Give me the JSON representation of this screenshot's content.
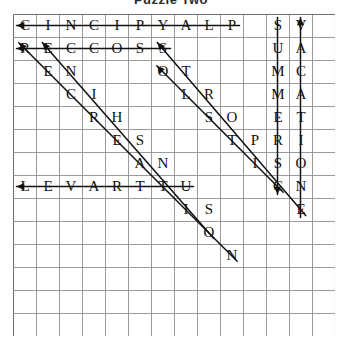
{
  "title": "Puzzle Two",
  "grid": {
    "columns": 13,
    "rows": 14,
    "cell_size": 23,
    "line_color": "#8e8e96",
    "border_color": "#6f6f78",
    "letter_color": "#101010",
    "mark_color": "#111111",
    "rows_letters": [
      [
        "C",
        "I",
        "N",
        "C",
        "I",
        "P",
        "Y",
        "A",
        "L",
        "P",
        "",
        "S",
        "V",
        ""
      ],
      [
        "R",
        "E",
        "C",
        "C",
        "O",
        "S",
        "S",
        "",
        "",
        "",
        "U",
        "A",
        ""
      ],
      [
        "",
        "E",
        "N",
        "",
        "",
        "O",
        "T",
        "",
        "",
        "",
        "M",
        "C",
        ""
      ],
      [
        "",
        "",
        "C",
        "I",
        "",
        "L",
        "R",
        "",
        "",
        "",
        "M",
        "A",
        ""
      ],
      [
        "",
        "",
        "",
        "R",
        "H",
        "",
        "S",
        "O",
        "",
        "",
        "E",
        "T",
        ""
      ],
      [
        "",
        "",
        "",
        "",
        "E",
        "S",
        "",
        "T",
        "P",
        "",
        "R",
        "I",
        ""
      ],
      [
        "",
        "",
        "",
        "",
        "",
        "A",
        "N",
        "",
        "I",
        "S",
        "S",
        "O",
        ""
      ],
      [
        "L",
        "E",
        "V",
        "A",
        "R",
        "T",
        "T",
        "U",
        "",
        "",
        "C",
        "N",
        ""
      ],
      [
        "",
        "",
        "",
        "",
        "",
        "",
        "",
        "I",
        "S",
        "",
        "",
        "E",
        ""
      ],
      [
        "",
        "",
        "",
        "",
        "",
        "",
        "",
        "",
        "O",
        "",
        "",
        "",
        ""
      ],
      [
        "",
        "",
        "",
        "",
        "",
        "",
        "",
        "",
        "",
        "N",
        "",
        "",
        ""
      ],
      [
        "",
        "",
        "",
        "",
        "",
        "",
        "",
        "",
        "",
        "",
        "",
        "",
        ""
      ],
      [
        "",
        "",
        "",
        "",
        "",
        "",
        "",
        "",
        "",
        "",
        "",
        "",
        ""
      ],
      [
        "",
        "",
        "",
        "",
        "",
        "",
        "",
        "",
        "",
        "",
        "",
        "",
        ""
      ]
    ],
    "letters": [
      {
        "r": 0,
        "c": 0,
        "ch": "C"
      },
      {
        "r": 0,
        "c": 1,
        "ch": "I"
      },
      {
        "r": 0,
        "c": 2,
        "ch": "N"
      },
      {
        "r": 0,
        "c": 3,
        "ch": "C"
      },
      {
        "r": 0,
        "c": 4,
        "ch": "I"
      },
      {
        "r": 0,
        "c": 5,
        "ch": "P"
      },
      {
        "r": 0,
        "c": 6,
        "ch": "Y"
      },
      {
        "r": 0,
        "c": 7,
        "ch": "A"
      },
      {
        "r": 0,
        "c": 8,
        "ch": "L"
      },
      {
        "r": 0,
        "c": 9,
        "ch": "P"
      },
      {
        "r": 0,
        "c": 11,
        "ch": "S"
      },
      {
        "r": 0,
        "c": 12,
        "ch": "V"
      },
      {
        "r": 1,
        "c": 0,
        "ch": "R"
      },
      {
        "r": 1,
        "c": 1,
        "ch": "E"
      },
      {
        "r": 1,
        "c": 2,
        "ch": "C"
      },
      {
        "r": 1,
        "c": 3,
        "ch": "C"
      },
      {
        "r": 1,
        "c": 4,
        "ch": "O"
      },
      {
        "r": 1,
        "c": 5,
        "ch": "S"
      },
      {
        "r": 1,
        "c": 6,
        "ch": "S"
      },
      {
        "r": 1,
        "c": 11,
        "ch": "U"
      },
      {
        "r": 1,
        "c": 12,
        "ch": "A"
      },
      {
        "r": 2,
        "c": 1,
        "ch": "E"
      },
      {
        "r": 2,
        "c": 2,
        "ch": "N"
      },
      {
        "r": 2,
        "c": 6,
        "ch": "O"
      },
      {
        "r": 2,
        "c": 7,
        "ch": "T"
      },
      {
        "r": 2,
        "c": 11,
        "ch": "M"
      },
      {
        "r": 2,
        "c": 12,
        "ch": "C"
      },
      {
        "r": 3,
        "c": 2,
        "ch": "C"
      },
      {
        "r": 3,
        "c": 3,
        "ch": "I"
      },
      {
        "r": 3,
        "c": 7,
        "ch": "L"
      },
      {
        "r": 3,
        "c": 8,
        "ch": "R"
      },
      {
        "r": 3,
        "c": 11,
        "ch": "M"
      },
      {
        "r": 3,
        "c": 12,
        "ch": "A"
      },
      {
        "r": 4,
        "c": 3,
        "ch": "R"
      },
      {
        "r": 4,
        "c": 4,
        "ch": "H"
      },
      {
        "r": 4,
        "c": 8,
        "ch": "S"
      },
      {
        "r": 4,
        "c": 9,
        "ch": "O"
      },
      {
        "r": 4,
        "c": 11,
        "ch": "E"
      },
      {
        "r": 4,
        "c": 12,
        "ch": "T"
      },
      {
        "r": 5,
        "c": 4,
        "ch": "E"
      },
      {
        "r": 5,
        "c": 5,
        "ch": "S"
      },
      {
        "r": 5,
        "c": 9,
        "ch": "T"
      },
      {
        "r": 5,
        "c": 10,
        "ch": "P"
      },
      {
        "r": 5,
        "c": 11,
        "ch": "R"
      },
      {
        "r": 5,
        "c": 12,
        "ch": "I"
      },
      {
        "r": 6,
        "c": 5,
        "ch": "A"
      },
      {
        "r": 6,
        "c": 6,
        "ch": "N"
      },
      {
        "r": 6,
        "c": 10,
        "ch": "I"
      },
      {
        "r": 6,
        "c": 11,
        "ch": "S"
      },
      {
        "r": 6,
        "c": 12,
        "ch": "O"
      },
      {
        "r": 7,
        "c": 0,
        "ch": "L"
      },
      {
        "r": 7,
        "c": 1,
        "ch": "E"
      },
      {
        "r": 7,
        "c": 2,
        "ch": "V"
      },
      {
        "r": 7,
        "c": 3,
        "ch": "A"
      },
      {
        "r": 7,
        "c": 4,
        "ch": "R"
      },
      {
        "r": 7,
        "c": 5,
        "ch": "T"
      },
      {
        "r": 7,
        "c": 6,
        "ch": "T"
      },
      {
        "r": 7,
        "c": 7,
        "ch": "U"
      },
      {
        "r": 7,
        "c": 11,
        "ch": "C"
      },
      {
        "r": 7,
        "c": 12,
        "ch": "N"
      },
      {
        "r": 8,
        "c": 7,
        "ch": "I"
      },
      {
        "r": 8,
        "c": 8,
        "ch": "S"
      },
      {
        "r": 8,
        "c": 12,
        "ch": "E"
      },
      {
        "r": 9,
        "c": 8,
        "ch": "O"
      },
      {
        "r": 10,
        "c": 9,
        "ch": "N"
      }
    ],
    "marks": [
      {
        "name": "strike-playpicnic",
        "kind": "line",
        "r1": 0,
        "c1": 9,
        "r2": 0,
        "c2": 0,
        "arrow": "end"
      },
      {
        "name": "strike-soccers",
        "kind": "line",
        "r1": 1,
        "c1": 6,
        "r2": 1,
        "c2": 0,
        "arrow": "end"
      },
      {
        "name": "strike-travel",
        "kind": "line",
        "r1": 7,
        "c1": 7,
        "r2": 7,
        "c2": 0,
        "arrow": "end"
      },
      {
        "name": "strike-summers",
        "kind": "line",
        "r1": 0,
        "c1": 11,
        "r2": 7,
        "c2": 11,
        "arrow": "end"
      },
      {
        "name": "strike-vacation",
        "kind": "line",
        "r1": 8,
        "c1": 12,
        "r2": 0,
        "c2": 12,
        "arrow": "end"
      },
      {
        "name": "strike-recreation",
        "kind": "line",
        "r1": 1,
        "c1": 0,
        "r2": 10,
        "c2": 9,
        "arrow": "start"
      },
      {
        "name": "strike-encreation",
        "kind": "line",
        "r1": 1,
        "c1": 1,
        "r2": 9,
        "c2": 8,
        "arrow": "start"
      },
      {
        "name": "strike-solstice",
        "kind": "line",
        "r1": 1,
        "c1": 6,
        "r2": 8,
        "c2": 12,
        "arrow": "start"
      },
      {
        "name": "strike-sports",
        "kind": "line",
        "r1": 2,
        "c1": 6,
        "r2": 7,
        "c2": 11,
        "arrow": "start"
      }
    ]
  }
}
